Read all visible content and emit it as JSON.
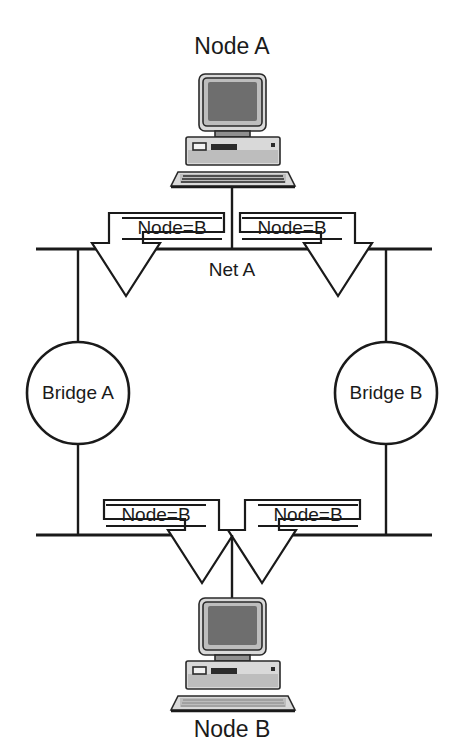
{
  "diagram": {
    "nodes": {
      "top_node_label": "Node A",
      "bottom_node_label": "Node B"
    },
    "network": {
      "top_bus_label": "Net A"
    },
    "bridges": [
      {
        "id": "bridge-a",
        "label": "Bridge A"
      },
      {
        "id": "bridge-b",
        "label": "Bridge B"
      }
    ],
    "packets": [
      {
        "id": "packet-top-left",
        "label": "Node=B",
        "direction": "down"
      },
      {
        "id": "packet-top-right",
        "label": "Node=B",
        "direction": "down"
      },
      {
        "id": "packet-bottom-left",
        "label": "Node=B",
        "direction": "down"
      },
      {
        "id": "packet-bottom-right",
        "label": "Node=B",
        "direction": "down"
      }
    ],
    "colors": {
      "ink": "#1a1a1a",
      "background": "#ffffff",
      "screen": "#6e6e6e",
      "chassis": "#d9d9d9"
    }
  }
}
